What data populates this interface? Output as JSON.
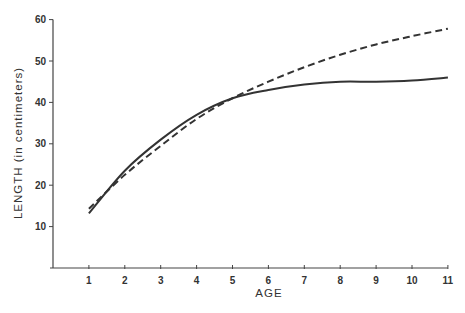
{
  "chart_data": {
    "type": "line",
    "title": "",
    "xlabel": "AGE",
    "ylabel": "LENGTH (in centimeters)",
    "x": [
      1,
      2,
      3,
      4,
      5,
      6,
      7,
      8,
      9,
      10,
      11
    ],
    "x_ticks": [
      "1",
      "2",
      "3",
      "4",
      "5",
      "6",
      "7",
      "8",
      "9",
      "10",
      "11"
    ],
    "y_ticks": [
      "10",
      "20",
      "30",
      "40",
      "50",
      "60"
    ],
    "xlim": [
      0,
      11
    ],
    "ylim": [
      0,
      60
    ],
    "grid": false,
    "legend": null,
    "series": [
      {
        "name": "solid",
        "style": "solid",
        "values": [
          13.2,
          23.5,
          31,
          37,
          41,
          43,
          44.3,
          45,
          45,
          45.3,
          46
        ]
      },
      {
        "name": "dashed",
        "style": "dashed",
        "values": [
          14.3,
          22.5,
          29.5,
          36,
          41,
          45,
          48.5,
          51.5,
          54,
          56,
          57.8
        ]
      }
    ]
  },
  "colors": {
    "line": "#333333",
    "axis": "#444444"
  }
}
